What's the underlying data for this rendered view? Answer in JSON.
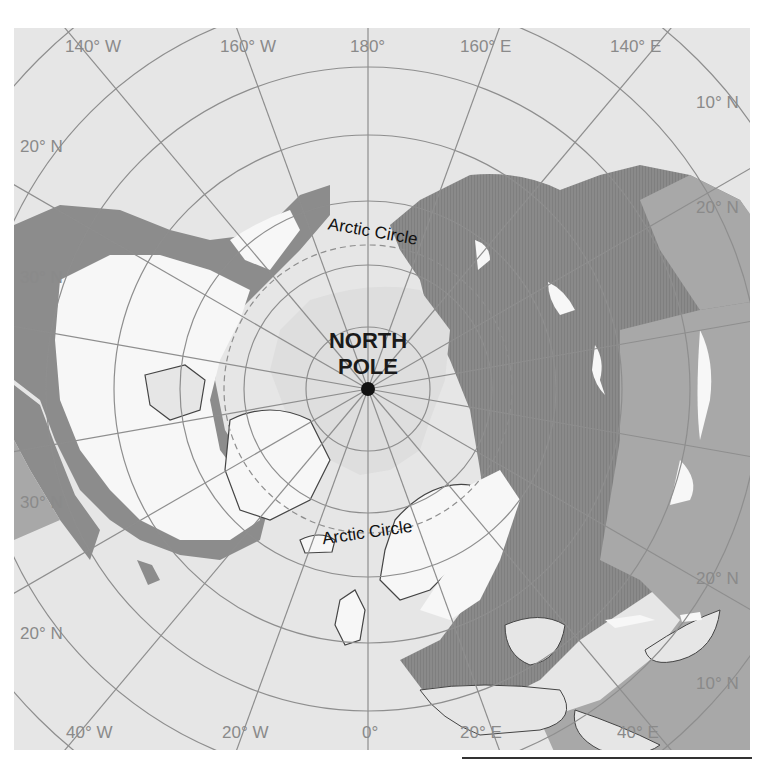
{
  "map": {
    "projection": "north polar azimuthal",
    "center_label": {
      "line1": "NORTH",
      "line2": "POLE"
    },
    "arctic_circle_labels": [
      "Arctic Circle",
      "Arctic Circle"
    ],
    "longitude_labels": {
      "top": [
        "140° W",
        "160° W",
        "180°",
        "160° E",
        "140° E"
      ],
      "bottom": [
        "40° W",
        "20° W",
        "0°",
        "20° E",
        "40° E"
      ]
    },
    "latitude_labels": {
      "left": [
        "20° N",
        "30° N",
        "30° N",
        "20° N"
      ],
      "right": [
        "10° N",
        "20° N",
        "20° N",
        "10° N"
      ]
    },
    "colors": {
      "ocean": "#e6e6e6",
      "ice_snow": "#f7f7f7",
      "arctic_ocean_ice": "#dedede",
      "dark_land": "#8c8c8c",
      "medium_land": "#a8a8a8",
      "grid": "#8e8e8e",
      "coastline": "#444444"
    }
  }
}
